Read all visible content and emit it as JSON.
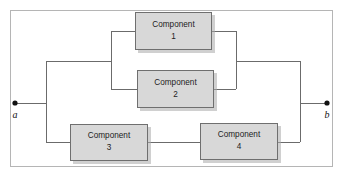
{
  "diagram": {
    "type": "reliability-block-diagram",
    "title": "",
    "frame": {
      "x": 10,
      "y": 10,
      "width": 323,
      "height": 157,
      "border_color": "#b5b5b5"
    },
    "colors": {
      "block_fill": "#d8d8d8",
      "block_border": "#6f6f6f",
      "wire": "#6b6b6b",
      "text": "#1c1c1c",
      "terminal": "#111111",
      "background": "#ffffff"
    },
    "terminals": [
      {
        "id": "a",
        "label": "a",
        "x": 15,
        "y": 103,
        "label_x": 15,
        "label_y": 117
      },
      {
        "id": "b",
        "label": "b",
        "x": 327,
        "y": 103,
        "label_x": 327,
        "label_y": 117
      }
    ],
    "blocks": [
      {
        "id": "component-1",
        "name_line1": "Component",
        "name_line2": "1",
        "x": 135,
        "y": 12,
        "width": 77,
        "height": 38
      },
      {
        "id": "component-2",
        "name_line1": "Component",
        "name_line2": "2",
        "x": 137,
        "y": 70,
        "width": 77,
        "height": 38
      },
      {
        "id": "component-3",
        "name_line1": "Component",
        "name_line2": "3",
        "x": 70,
        "y": 124,
        "width": 78,
        "height": 37
      },
      {
        "id": "component-4",
        "name_line1": "Component",
        "name_line2": "4",
        "x": 200,
        "y": 123,
        "width": 78,
        "height": 37
      }
    ],
    "wires": {
      "left_lead": "M15,103 H46",
      "right_lead": "M300,103 H327",
      "left_bus": "M46,61 V142",
      "right_bus": "M300,61 V142",
      "top_left_branch": "M46,61 H111",
      "top_right_branch": "M236,61 H300",
      "inner_left_bus": "M111,31 V89",
      "inner_right_bus": "M236,31 V89",
      "c1_in": "M111,31 H135",
      "c1_out": "M212,31 H236",
      "c2_in": "M111,89 H137",
      "c2_out": "M214,89 H236",
      "bottom_left_branch": "M46,142 H70",
      "c3_to_c4": "M148,142 H200",
      "bottom_right_branch": "M278,142 H300"
    },
    "structure_notes": {
      "series_parallel": "Components 1 and 2 in parallel; that pair in series-parallel with series chain of Components 3 and 4; whole network between terminals a and b"
    }
  }
}
